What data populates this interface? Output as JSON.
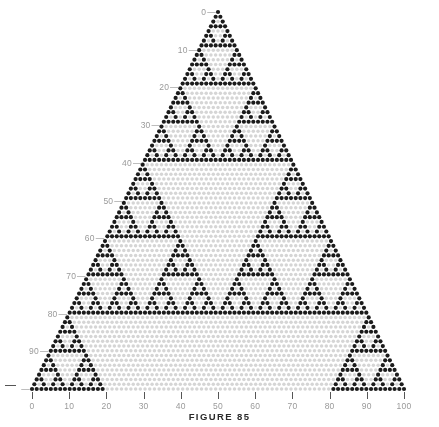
{
  "figure": {
    "caption": "FIGURE 85"
  },
  "chart_data": {
    "type": "scatter",
    "title": "FIGURE 85",
    "rows": 80,
    "xlabel": "",
    "ylabel": "",
    "xlim": [
      0,
      100
    ],
    "ylim": [
      0,
      100
    ],
    "grid": false,
    "legend": "none",
    "x_ticks": [
      0,
      10,
      20,
      30,
      40,
      50,
      60,
      70,
      80,
      90,
      100
    ],
    "x_tick_labels": [
      "0",
      "10",
      "20",
      "30",
      "40",
      "50",
      "60",
      "70",
      "80",
      "90",
      "100"
    ],
    "y_ticks": [
      0,
      10,
      20,
      30,
      40,
      50,
      60,
      70,
      80,
      90,
      100
    ],
    "y_tick_labels": [
      "0",
      "10",
      "20",
      "30",
      "40",
      "50",
      "60",
      "70",
      "80",
      "90",
      "100"
    ],
    "colors": {
      "odd_dot": "#1b1b1b",
      "even_dot": "#d5d5d5",
      "tick": "#555555",
      "tick_label": "#9a9a9a",
      "background": "#ffffff"
    },
    "geometry": {
      "apex_x": 218,
      "apex_y": 12,
      "base_y": 389,
      "base_left_x": 32,
      "base_right_x": 404,
      "dot_radius": 1.75
    }
  },
  "axes": {
    "left": {
      "name": "left-axis",
      "ticks": [
        {
          "value": 0,
          "label": "0"
        },
        {
          "value": 10,
          "label": "10"
        },
        {
          "value": 20,
          "label": "20"
        },
        {
          "value": 30,
          "label": "30"
        },
        {
          "value": 40,
          "label": "40"
        },
        {
          "value": 50,
          "label": "50"
        },
        {
          "value": 60,
          "label": "60"
        },
        {
          "value": 70,
          "label": "70"
        },
        {
          "value": 80,
          "label": "80"
        },
        {
          "value": 90,
          "label": "90"
        },
        {
          "value": 100,
          "label": ""
        }
      ]
    },
    "bottom": {
      "name": "bottom-axis",
      "ticks": [
        {
          "value": 0,
          "label": "0"
        },
        {
          "value": 10,
          "label": "10"
        },
        {
          "value": 20,
          "label": "20"
        },
        {
          "value": 30,
          "label": "30"
        },
        {
          "value": 40,
          "label": "40"
        },
        {
          "value": 50,
          "label": "50"
        },
        {
          "value": 60,
          "label": "60"
        },
        {
          "value": 70,
          "label": "70"
        },
        {
          "value": 80,
          "label": "80"
        },
        {
          "value": 90,
          "label": "90"
        },
        {
          "value": 100,
          "label": "100"
        }
      ]
    }
  }
}
